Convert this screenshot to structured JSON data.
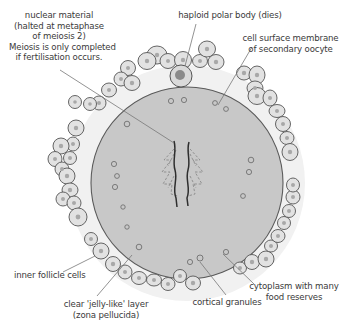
{
  "diagram": {
    "title": "Secondary oocyte",
    "labels": {
      "nuclear_material": [
        "nuclear material",
        "(halted at metaphase",
        "of meiosis 2)",
        "Meiosis is only completed",
        "if fertilisation occurs."
      ],
      "polar_body": "haploid polar body (dies)",
      "cell_membrane": [
        "cell surface membrane",
        "of secondary oocyte"
      ],
      "inner_follicle": "inner follicle cells",
      "zona_pellucida": [
        "clear 'jelly-like' layer",
        "(zona pellucida)"
      ],
      "cortical_granules": "cortical granules",
      "cytoplasm": [
        "cytoplasm with many",
        "food reserves"
      ]
    },
    "colors": {
      "cytoplasm": "#c8c8c8",
      "zona": "#f0f0f0",
      "follicle_cell": "#e2e2e2",
      "nucleus_dot": "#a8a8a8",
      "outline": "#555555",
      "leader_line": "#777777",
      "text": "#3a3a3a"
    }
  }
}
